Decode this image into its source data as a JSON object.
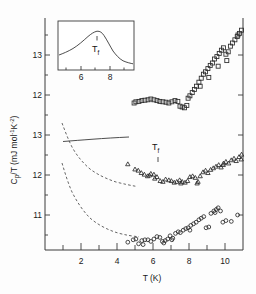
{
  "figure": {
    "title": "",
    "xlabel": "T (K)",
    "ylabel_parts": {
      "main": "C",
      "sub1": "p",
      "mid": "/T  (mJ mol",
      "sup1": "-1",
      "mid2": "K",
      "sup2": "-2",
      "close": ")"
    },
    "ylabel_plain": "Cp/T (mJ mol-1 K-2)",
    "tf_label_main": "T",
    "tf_label_sub": "f",
    "tf_label_inset_main": "T",
    "tf_label_inset_sub": "f"
  },
  "axes": {
    "x_ticks_major": [
      2,
      4,
      6,
      8,
      10
    ],
    "x_ticks_minor": [
      1,
      3,
      5,
      7,
      9,
      11
    ],
    "x_range": [
      0.6,
      11.7
    ],
    "y_ticks_upper": [
      {
        "label": "13",
        "value": 13
      },
      {
        "label": "12",
        "value": 12
      }
    ],
    "y_ticks_lower": [
      {
        "label": "13",
        "value": 13
      },
      {
        "label": "12",
        "value": 12
      },
      {
        "label": "11",
        "value": 11
      }
    ],
    "y_range_px": [
      18,
      250
    ]
  },
  "inset": {
    "x_ticks": [
      6,
      8
    ],
    "xlim": [
      4.8,
      9.8
    ],
    "peak_t": 7.1,
    "curve": [
      [
        4.8,
        0.3
      ],
      [
        5.2,
        0.36
      ],
      [
        5.6,
        0.43
      ],
      [
        6.0,
        0.52
      ],
      [
        6.3,
        0.62
      ],
      [
        6.6,
        0.74
      ],
      [
        6.9,
        0.86
      ],
      [
        7.1,
        0.93
      ],
      [
        7.35,
        0.9
      ],
      [
        7.6,
        0.78
      ],
      [
        7.9,
        0.62
      ],
      [
        8.2,
        0.46
      ],
      [
        8.5,
        0.34
      ],
      [
        8.9,
        0.24
      ],
      [
        9.3,
        0.17
      ],
      [
        9.8,
        0.13
      ]
    ]
  },
  "chart_data": {
    "type": "scatter",
    "title": "",
    "xlabel": "T (K)",
    "ylabel": "Cp/T (mJ mol-1 K-2)",
    "xlim": [
      0.6,
      11.7
    ],
    "grid": false,
    "legend": "none",
    "annotations": [
      {
        "text": "Tf",
        "x": 7.0,
        "panel": "middle",
        "marker": "arrow"
      },
      {
        "text": "Tf",
        "x": 7.1,
        "panel": "inset",
        "marker": "arrow"
      }
    ],
    "series": [
      {
        "name": "squares-upper",
        "marker": "square",
        "panel": "upper",
        "points": [
          [
            5.05,
            11.83
          ],
          [
            5.22,
            11.84
          ],
          [
            5.38,
            11.86
          ],
          [
            5.55,
            11.87
          ],
          [
            5.72,
            11.88
          ],
          [
            5.88,
            11.9
          ],
          [
            6.05,
            11.88
          ],
          [
            6.22,
            11.86
          ],
          [
            6.38,
            11.84
          ],
          [
            6.55,
            11.83
          ],
          [
            6.72,
            11.82
          ],
          [
            6.88,
            11.8
          ],
          [
            7.05,
            11.83
          ],
          [
            7.22,
            11.86
          ],
          [
            7.38,
            11.84
          ],
          [
            7.5,
            11.72
          ],
          [
            7.62,
            11.7
          ],
          [
            7.75,
            11.68
          ],
          [
            7.88,
            11.74
          ],
          [
            7.95,
            11.92
          ],
          [
            8.05,
            11.98
          ],
          [
            8.18,
            12.06
          ],
          [
            8.3,
            12.14
          ],
          [
            8.42,
            12.22
          ],
          [
            8.55,
            12.32
          ],
          [
            8.68,
            12.42
          ],
          [
            8.8,
            12.52
          ],
          [
            8.92,
            12.58
          ],
          [
            9.05,
            12.66
          ],
          [
            9.18,
            12.74
          ],
          [
            9.3,
            12.8
          ],
          [
            9.42,
            12.9
          ],
          [
            9.55,
            12.96
          ],
          [
            9.68,
            13.04
          ],
          [
            9.8,
            13.12
          ],
          [
            9.92,
            13.18
          ],
          [
            10.05,
            13.02
          ],
          [
            10.18,
            13.08
          ],
          [
            10.3,
            13.22
          ],
          [
            10.42,
            13.3
          ],
          [
            10.55,
            13.38
          ],
          [
            10.68,
            13.46
          ],
          [
            10.8,
            13.54
          ],
          [
            10.92,
            13.62
          ],
          [
            8.62,
            12.22
          ],
          [
            9.1,
            12.44
          ],
          [
            9.62,
            12.72
          ],
          [
            10.1,
            12.86
          ],
          [
            10.72,
            13.5
          ],
          [
            4.95,
            11.8
          ]
        ]
      },
      {
        "name": "triangles-middle",
        "marker": "triangle",
        "panel": "middle",
        "points": [
          [
            4.6,
            12.28
          ],
          [
            5.0,
            12.15
          ],
          [
            5.18,
            12.12
          ],
          [
            5.35,
            12.06
          ],
          [
            5.52,
            12.02
          ],
          [
            5.7,
            11.98
          ],
          [
            5.88,
            12.04
          ],
          [
            6.05,
            12.02
          ],
          [
            6.22,
            11.96
          ],
          [
            6.4,
            11.86
          ],
          [
            6.55,
            11.84
          ],
          [
            6.7,
            11.9
          ],
          [
            6.88,
            11.88
          ],
          [
            7.02,
            11.86
          ],
          [
            7.18,
            11.82
          ],
          [
            7.32,
            11.84
          ],
          [
            7.48,
            11.88
          ],
          [
            7.62,
            11.84
          ],
          [
            7.78,
            11.82
          ],
          [
            7.92,
            11.86
          ],
          [
            8.05,
            11.96
          ],
          [
            8.2,
            11.98
          ],
          [
            8.35,
            11.94
          ],
          [
            8.5,
            11.84
          ],
          [
            8.62,
            11.98
          ],
          [
            8.78,
            12.08
          ],
          [
            8.92,
            12.12
          ],
          [
            9.05,
            12.06
          ],
          [
            9.2,
            12.14
          ],
          [
            9.35,
            12.18
          ],
          [
            9.5,
            12.22
          ],
          [
            9.65,
            12.26
          ],
          [
            9.78,
            12.2
          ],
          [
            9.92,
            12.3
          ],
          [
            10.05,
            12.34
          ],
          [
            10.2,
            12.3
          ],
          [
            10.35,
            12.38
          ],
          [
            10.5,
            12.42
          ],
          [
            10.62,
            12.36
          ],
          [
            10.78,
            12.46
          ],
          [
            10.92,
            12.52
          ],
          [
            11.05,
            12.94
          ],
          [
            11.35,
            13.04
          ],
          [
            11.5,
            13.06
          ],
          [
            6.1,
            11.92
          ],
          [
            7.55,
            11.8
          ],
          [
            8.45,
            11.8
          ],
          [
            9.9,
            12.26
          ],
          [
            10.9,
            12.4
          ],
          [
            5.8,
            12.0
          ]
        ]
      },
      {
        "name": "circles-lower",
        "marker": "circle",
        "panel": "lower",
        "points": [
          [
            4.6,
            10.32
          ],
          [
            4.9,
            10.38
          ],
          [
            5.05,
            10.4
          ],
          [
            5.2,
            10.28
          ],
          [
            5.38,
            10.36
          ],
          [
            5.55,
            10.38
          ],
          [
            5.72,
            10.38
          ],
          [
            5.88,
            10.34
          ],
          [
            6.05,
            10.4
          ],
          [
            6.22,
            10.46
          ],
          [
            6.38,
            10.44
          ],
          [
            6.52,
            10.34
          ],
          [
            6.68,
            10.36
          ],
          [
            6.82,
            10.4
          ],
          [
            6.95,
            10.48
          ],
          [
            7.1,
            10.42
          ],
          [
            7.25,
            10.54
          ],
          [
            7.4,
            10.58
          ],
          [
            7.52,
            10.56
          ],
          [
            7.68,
            10.62
          ],
          [
            7.82,
            10.66
          ],
          [
            7.95,
            10.68
          ],
          [
            8.1,
            10.74
          ],
          [
            8.25,
            10.78
          ],
          [
            8.4,
            10.82
          ],
          [
            8.55,
            10.88
          ],
          [
            8.68,
            10.92
          ],
          [
            8.82,
            10.96
          ],
          [
            8.95,
            10.68
          ],
          [
            9.1,
            10.7
          ],
          [
            9.22,
            11.04
          ],
          [
            9.38,
            11.1
          ],
          [
            9.52,
            11.14
          ],
          [
            9.62,
            11.18
          ],
          [
            9.75,
            11.1
          ],
          [
            9.88,
            10.82
          ],
          [
            10.05,
            10.86
          ],
          [
            10.35,
            10.84
          ],
          [
            10.7,
            11.0
          ],
          [
            11.15,
            11.78
          ],
          [
            6.6,
            10.3
          ],
          [
            7.05,
            10.38
          ],
          [
            8.05,
            10.62
          ],
          [
            9.45,
            11.06
          ],
          [
            5.45,
            10.26
          ]
        ]
      }
    ],
    "theory_curves": [
      {
        "name": "dashed-upper-decay",
        "panel": "middle",
        "style": "dashed",
        "points": [
          [
            0.95,
            13.38
          ],
          [
            1.2,
            13.05
          ],
          [
            1.5,
            12.8
          ],
          [
            1.9,
            12.58
          ],
          [
            2.4,
            12.42
          ],
          [
            3.0,
            12.3
          ],
          [
            3.8,
            12.18
          ],
          [
            4.6,
            12.08
          ],
          [
            5.4,
            12.0
          ],
          [
            6.0,
            11.95
          ]
        ]
      },
      {
        "name": "solid-rising",
        "panel": "middle",
        "style": "solid",
        "points": [
          [
            1.0,
            12.8
          ],
          [
            1.6,
            12.82
          ],
          [
            2.3,
            12.86
          ],
          [
            3.0,
            12.9
          ],
          [
            3.8,
            12.95
          ],
          [
            4.6,
            13.0
          ],
          [
            5.2,
            13.04
          ]
        ]
      },
      {
        "name": "dashed-lower-decay",
        "panel": "lower",
        "style": "dashed",
        "points": [
          [
            0.95,
            12.1
          ],
          [
            1.2,
            11.72
          ],
          [
            1.5,
            11.4
          ],
          [
            1.9,
            11.1
          ],
          [
            2.4,
            10.88
          ],
          [
            3.0,
            10.7
          ],
          [
            3.7,
            10.56
          ],
          [
            4.4,
            10.46
          ],
          [
            5.0,
            10.4
          ],
          [
            5.6,
            10.36
          ]
        ]
      }
    ]
  }
}
